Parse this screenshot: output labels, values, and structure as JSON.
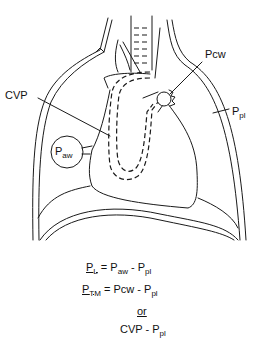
{
  "figure": {
    "type": "anatomical-diagram",
    "labels": {
      "cvp": "CVP",
      "pcw": "Pcw",
      "ppl": {
        "base": "P",
        "sub": "pl"
      },
      "paw": {
        "base": "P",
        "sub": "aw"
      }
    },
    "equations": [
      {
        "lhs": {
          "base": "P",
          "sub": "L"
        },
        "eq": "=",
        "rhs": [
          {
            "base": "P",
            "sub": "aw"
          },
          {
            "op": "-"
          },
          {
            "base": "P",
            "sub": "pl"
          }
        ]
      },
      {
        "lhs": {
          "base": "P",
          "sub": "TM"
        },
        "eq": "=",
        "rhs": [
          {
            "text": "Pcw"
          },
          {
            "op": "-"
          },
          {
            "base": "P",
            "sub": "pl"
          }
        ]
      },
      {
        "connector": "or"
      },
      {
        "rhs": [
          {
            "text": "CVP"
          },
          {
            "op": "-"
          },
          {
            "base": "P",
            "sub": "pl"
          }
        ]
      }
    ]
  },
  "text": {
    "cvp": "CVP",
    "pcw": "Pcw",
    "P": "P",
    "pl": "pl",
    "aw": "aw",
    "L": "L",
    "TM": "TM",
    "eq": "=",
    "minus": "-",
    "or": "or"
  }
}
